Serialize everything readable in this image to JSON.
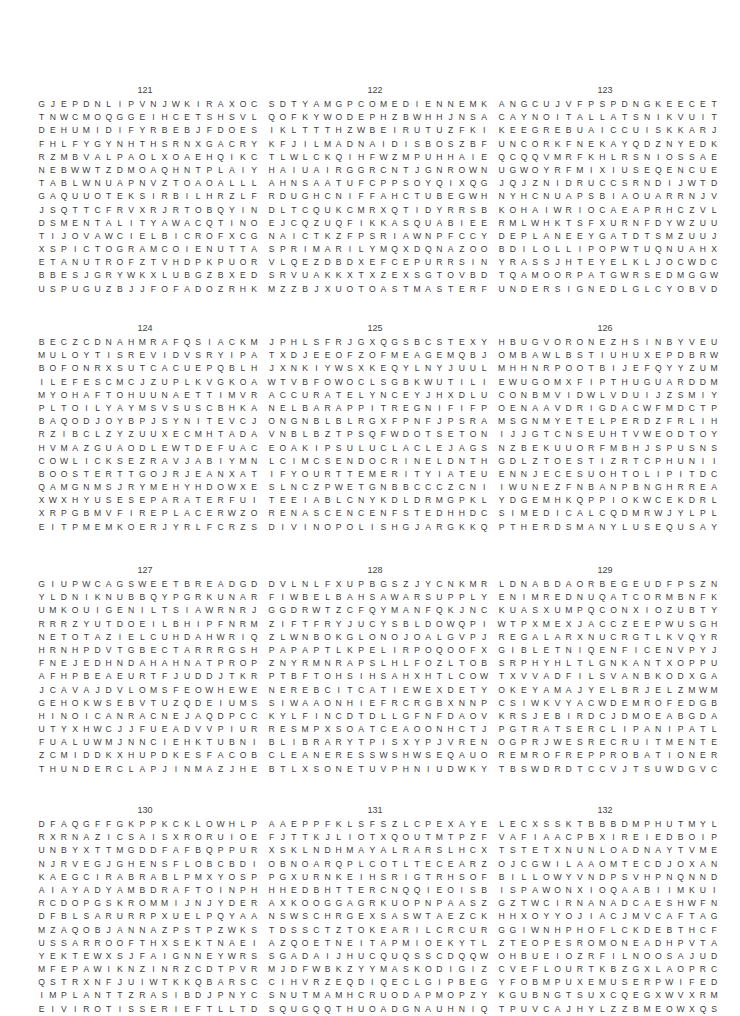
{
  "page": {
    "puzzles": [
      {
        "number": "121",
        "rows": [
          "GJEPDNLIPVNJWKIRAXOC",
          "TNWCMOQGGEIHCETSHSVL",
          "DEHUMIDIFYRBEBJFDOES",
          "FHLFYGYNHTHSRNXGACRY",
          "RZMBVALPAOLXOAEHQIKC",
          "NEBWWTZDMOAQHNTPLAIY",
          "TABLWNUAPNVZTOAOALLL",
          "GAQUUOTEKSIRBILHRZLF",
          "JSQTTCFRVXRJRTOBQYIN",
          "DSMENTALITYAWACQTINO",
          "TIJOVAWCIELBICROFXCG",
          "XSPICTOGRAMCOIENUTTA",
          "ETANUTROFZTVHDPKPUOR",
          "BBESJGRYWKXLUBGZBXED",
          "USPUGUZBJJFOFADOZRHK"
        ]
      },
      {
        "number": "122",
        "rows": [
          "SDTYAMGPCOMEDIENNEMK",
          "QOFKYWODEPHZBWHHJNSA",
          "IKLTTTHZWBEIRUTUZFKI",
          "KFJILMADNAIDISBOSZBF",
          "TLWLCKQIHFWZMPUHHAIE",
          "HAIUAIRGGRCNTJGNROWN",
          "AHNSAATUFCPPSOYQIXQG",
          "RDUGHCNIFFAHCTUBEGWH",
          "DLTCQUKCMRXQTIDYRRSB",
          "EJCQZUQFIKKASQUABIEE",
          "NAICTKZFPSRIAWNPFCCY",
          "SPRIMARILYMQXDQNAZOO",
          "VLQEZDBDXEFCEPURRSIN",
          "SRVUAKKXTXZEXSGTOVBD",
          "MZZBJXUOTOASTMASTERF"
        ]
      },
      {
        "number": "123",
        "rows": [
          "ANGCUJVFPSPDNGKEECET",
          "CAYNOITALLATSNIKVUIT",
          "KEEGREBUAICCUISKKARJ",
          "UNCORKFNEKAYQDZNYEDK",
          "QCQQVMRFKHLRSNIOSSAE",
          "UGWOYRFMIXIUSEQENCUE",
          "JQJZNIDRUCCSRNDIJWTD",
          "NYHCNUAPSBIAOUARRNJV",
          "KOHAIWRIOCAEAPRHCZVL",
          "RMLWHKTSFXURNFDYWZUU",
          "DEPLANEEYGATDTSMZUUJ",
          "BDILOLLIPOPWTUQNUAHX",
          "YRASSJHTEYELKLJOCWDC",
          "TQAMOORPATGWRSEDMGGW",
          "UNDERSIGNEDLGLCYOBVD"
        ]
      },
      {
        "number": "124",
        "rows": [
          "BECZCDNAHMRAFQSIACKM",
          "MULOYTISREVIDVSRYIPA",
          "BOFONRXSUTCACUEPQBLH",
          "ILEFESCMCJZUPLKVGKOA",
          "MYOHAFTOHUUNAETTIMVR",
          "PLTOILYAYMSVSUSCBHKA",
          "BAQODJOYBPJSYNITEVCJ",
          "RZIBCLZYZUUXECMHTADA",
          "HVMAZGUAODLEWTDEFUAC",
          "COWLICKSEZRAVJABIYMN",
          "BOOSTERTTGOJRJEANXAT",
          "QAMGNMSJRYMEHYHDOWXE",
          "XWXHYUSESEPARATERFUI",
          "XRPGBMVFIREPLACERWZO",
          "EITPMEMKOERJYRLFCRZS"
        ]
      },
      {
        "number": "125",
        "rows": [
          "JPHLSFRJGXQGSBCSTEXY",
          "TXDJEEOFZOFMEAGEMQBJ",
          "JXNKIYWSXKEQYLNYJUUL",
          "WTVBFOWOCLSGBKWUTILI",
          "ACCURATELYNCEYJHXDLU",
          "NELBARAPPITREGNIFIFP",
          "ONGNBLBLRGXFPNFJPSRA",
          "VNBLBZTPSQFWDOTSETON",
          "EOAKIPSULUCLACLEJAGS",
          "LCIMCSENDOCRINELDNTH",
          "IFYOURTTEMERITYIATEU",
          "SLNCZPWETGNBBCCCZCNI",
          "TEEIABLCNYKDLDRMGPKL",
          "RENASCENCENFSTEDHHDC",
          "DIVINOPOLISHGJARGKKQ"
        ]
      },
      {
        "number": "126",
        "rows": [
          "HBUGVORONEZHSINBYVEU",
          "OMBAWLBSTIUHUXEPDBRW",
          "MHHNRPOOTBIJEFQYYZUM",
          "EWUGOMXFIPTHUGUARDDM",
          "CONBMVIDWLVDUIJZSMIY",
          "OENAAVDRIGDACWFMDCTP",
          "MSGNMYETELPERDZFRLIH",
          "IJJGTCNSEUHTVWEODTOY",
          "NZBEKUUORFMBHJSPUSNS",
          "GDLZTOESTIZRTCPHUNII",
          "ENNJECESUOHTOLIPITDC",
          "IWUNEZFNBANPBNGHRREA",
          "YDGEMHKQPPIOKWCEKDRL",
          "SIMEDICALCQDMRWJYLPL",
          "PTHERDSMANYLUSEQUSAY"
        ]
      },
      {
        "number": "127",
        "rows": [
          "GIUPWCAGSWEETBREADGD",
          "YLDNIKNUBBQYPGRKUNAR",
          "UMKOUIGENILTSIAWRNRJ",
          "RRRZYUTDOEILBHIPFNRM",
          "NETOTAZIELCUHDAHWRIQ",
          "HRNHPDVTGBECTARRRGSH",
          "FNEJEDHNDAHAHNATPROP",
          "AFHPBEAEURTFJUDDJTKR",
          "JCAVAJDVLOMSFEOWHEWE",
          "GEHOKWSEBVTUZQDEIUMS",
          "HINOICANRACNEJAQDPCC",
          "UTYXHWCJJFUEADVVPIUR",
          "FUALUWMJNNCIEHKTUBNI",
          "ZCMIDDKXHUPDKESFACOB",
          "THUNDERCLAPJINMAZJHE"
        ]
      },
      {
        "number": "128",
        "rows": [
          "DVLNLFXUPBGSZJYCNKMR",
          "FIWBELBAHSAWARSUPPLY",
          "GGDRWTZCFQYMANFQKJNC",
          "ZIFTFRYJUCYSBLDOWQPI",
          "ZLWNBOKGLONOJOALGVPJ",
          "PAPAPTLKPELIRPOQOOFX",
          "ZNYRMNRAPSLHLFOZLTOB",
          "PTBFTOHSIHSAHXHTLCOW",
          "NEREBCITCATIEWEXDETY",
          "SIWAAONHIEFRCRGBXNNP",
          "KYLFINCDTDLLGFNFDAOV",
          "RESMPXSOATCEAOONHCTJ",
          "BLIBRARYTPISXYPJVREN",
          "CLEANERESSWSHWSEQAUO",
          "BTLXSONETUVPHNIUDWKY"
        ]
      },
      {
        "number": "129",
        "rows": [
          "LDNABDAORBEGEUDFPSZN",
          "ENIMREDNUQATCORMBNFK",
          "KUASXUMPQCONXIOZUBTY",
          "WTPXMEXJACCZEEPWUSGH",
          "REGALARXNUCRGTLKVQYR",
          "GIBLETNIQENFICENVPYJ",
          "SRPHYHLTLGNKANTXOPPU",
          "TXVVADFILSVANBKODXGA",
          "OKEYAMAJYELBRJELZMWM",
          "CSIWKVYACWDEMROFEDGB",
          "KRSJEBIRDCJDMOEABGDA",
          "PGTRATSERCLIPANIPATL",
          "OGPRJWESRECRUITMENTE",
          "REMROFREPPROBATIONERL",
          "TBSWDRDTCCVJTSUWDGVC"
        ]
      },
      {
        "number": "130",
        "rows": [
          "DFAQGFFGKPPKCKLOWHLP",
          "RXRNAZICSAISXRORUIOE",
          "UNBYXTTMGDDFAFBQPPUR",
          "NJRVEGJGHENSFLOBCBDI",
          "KAEGCIRABRABLPMXYOSP",
          "AIAYADYAMBDRAFTOINPH",
          "RCDOPGSKROMMIJNJYDER",
          "DFBLSARURRPXUELPQYAA",
          "MZAQOBJANNAZPSTPZWKS",
          "USSARROOFTHXSEKTNAEI",
          "YEKTEWXSJFAIGNNEYWRS",
          "MFEPAWIKNZINRZCDTPVR",
          "QSTRXNFJUIWTKKQBARSC",
          "IMPLANTTZRASIBDJPNYC",
          "EIVIROTISSERIEFTLLTD"
        ]
      },
      {
        "number": "131",
        "rows": [
          "AAEPPFKLSFSZLCPEXAYE",
          "FJTTKJLIOTXQOUTMTPZF",
          "XSKLNDHMAYALRARSLHCX",
          "OBNOARQPLCOTLTECEARZ",
          "PGXURNKEIHSRIGTRHSOF",
          "HHEDBHTTERCNQQIEOISB",
          "AXKOOGGAGRKUOPNPAASZ",
          "NSWSCHRGEXSASWTAEZCK",
          "TDSSCTZTOKEARILCRCUR",
          "AZQOETNEITAPMIOEKYTL",
          "SGADAIJHUCQUQSSCDQQW",
          "MJDFWBKZYYMASKODIGIZ",
          "CIHVRZEQDIQECLGIPBEG",
          "SNUTMAMHCRUODAPMOPZY",
          "SQUGQQTHUOADGNAUHNIQ"
        ]
      },
      {
        "number": "132",
        "rows": [
          "LECXSSKTBBBDMPHUTMYL",
          "VAFIAACPBXIREIEDBOIP",
          "TSTETXNUNLOADNAYTVME",
          "OJCGWILAAOMTECDJOXAN",
          "BILLOWYVNDPSVHPNQNND",
          "ISPAWONXIOQAABIIMKUI",
          "GZTWCIRNANADCAESHWFN",
          "HHXOYYOJIACJMVCAFTAG",
          "GGIWNHPHOFLCKDEBTHCF",
          "ZTEOPESROMONEADHPVTA",
          "OHBUEIOZRFILNOOSAJUD",
          "CVEFLOURTKBZGXLAOPRC",
          "YFOBMPUXEMUSERPWIFED",
          "KGUBNGTSUXCQEGXWVXRM",
          "TPUVCAJHYLZZBMEOWXQS"
        ]
      }
    ]
  }
}
